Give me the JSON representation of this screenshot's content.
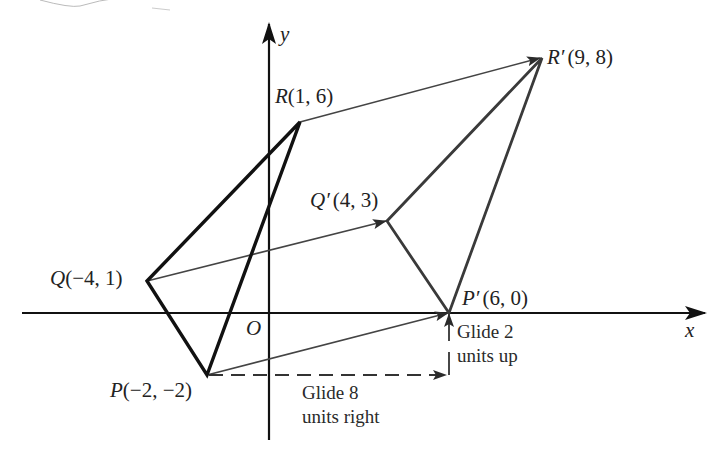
{
  "figure": {
    "axes": {
      "x_label": "x",
      "y_label": "y",
      "origin_label": "O"
    },
    "original_triangle": {
      "P": {
        "name": "P",
        "coords": "(−2, −2)",
        "x": -2,
        "y": -2
      },
      "Q": {
        "name": "Q",
        "coords": "(−4, 1)",
        "x": -4,
        "y": 1
      },
      "R": {
        "name": "R",
        "coords": "(1, 6)",
        "x": 1,
        "y": 6
      }
    },
    "image_triangle": {
      "P_prime": {
        "name": "P′",
        "coords": "(6, 0)",
        "x": 6,
        "y": 0
      },
      "Q_prime": {
        "name": "Q′",
        "coords": "(4, 3)",
        "x": 4,
        "y": 3
      },
      "R_prime": {
        "name": "R′",
        "coords": "(9, 8)",
        "x": 9,
        "y": 8
      }
    },
    "annotations": {
      "glide_right_line1": "Glide 8",
      "glide_right_line2": "units right",
      "glide_up_line1": "Glide 2",
      "glide_up_line2": "units up"
    },
    "colors": {
      "original": "#111111",
      "image": "#3a3a3a",
      "vector": "#444444",
      "axis": "#111111"
    }
  }
}
